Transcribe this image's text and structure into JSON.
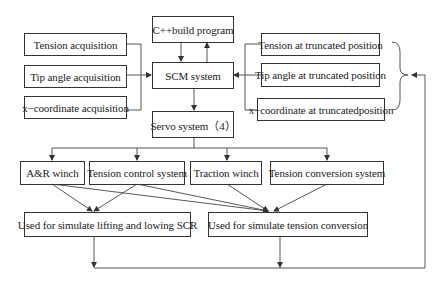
{
  "diagram": {
    "core": {
      "cpp_program": "C++build program",
      "scm_system": "SCM system",
      "servo_system": "Servo system（4）"
    },
    "acquisition_inputs": [
      "Tension acquisition",
      "Tip angle acquisition",
      "x−coordinate acquisition"
    ],
    "truncated_inputs": [
      "Tension at truncated position",
      "Tip angle at truncated position",
      "x−coordinate at truncatedposition"
    ],
    "actuators": [
      "A&R winch",
      "Tension control system",
      "Traction winch",
      "Tension conversion system"
    ],
    "outputs": [
      "Used for simulate lifting and lowing SCR",
      "Used for simulate tension conversion"
    ],
    "edges": [
      {
        "from": "Tension acquisition",
        "to": "SCM system"
      },
      {
        "from": "Tip angle acquisition",
        "to": "SCM system"
      },
      {
        "from": "x−coordinate acquisition",
        "to": "SCM system"
      },
      {
        "from": "C++build program",
        "to": "SCM system"
      },
      {
        "from": "SCM system",
        "to": "C++build program"
      },
      {
        "from": "Tension at truncated position",
        "to": "SCM system"
      },
      {
        "from": "Tip angle at truncated position",
        "to": "SCM system"
      },
      {
        "from": "x−coordinate at truncatedposition",
        "to": "SCM system"
      },
      {
        "from": "SCM system",
        "to": "Servo system（4）"
      },
      {
        "from": "Servo system（4）",
        "to": "A&R winch"
      },
      {
        "from": "Servo system（4）",
        "to": "Tension control system"
      },
      {
        "from": "Servo system（4）",
        "to": "Traction winch"
      },
      {
        "from": "Servo system（4）",
        "to": "Tension conversion system"
      },
      {
        "from": "A&R winch",
        "to": "Used for simulate lifting and lowing SCR"
      },
      {
        "from": "Tension control system",
        "to": "Used for simulate lifting and lowing SCR"
      },
      {
        "from": "A&R winch",
        "to": "Used for simulate tension conversion"
      },
      {
        "from": "Tension control system",
        "to": "Used for simulate tension conversion"
      },
      {
        "from": "Traction winch",
        "to": "Used for simulate tension conversion"
      },
      {
        "from": "Tension conversion system",
        "to": "Used for simulate tension conversion"
      },
      {
        "from": "Used for simulate lifting and lowing SCR",
        "to": "truncated inputs (feedback loop)"
      },
      {
        "from": "Used for simulate tension conversion",
        "to": "truncated inputs (feedback loop)"
      }
    ]
  },
  "colors": {
    "line": "#333333",
    "box_border": "#333333",
    "background": "#ffffff"
  }
}
